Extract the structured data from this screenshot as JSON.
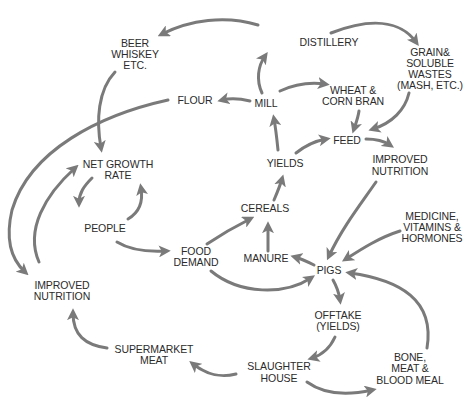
{
  "diagram": {
    "colors": {
      "arrow": "#7a7a7a",
      "text": "#2b2b2b",
      "background": "#ffffff"
    },
    "nodes": [
      {
        "id": "beer",
        "lines": [
          "BEER",
          "WHISKEY",
          "ETC."
        ],
        "x": 135,
        "y": [
          47,
          58,
          69
        ]
      },
      {
        "id": "distillery",
        "lines": [
          "DISTILLERY"
        ],
        "x": 329,
        "y": [
          46
        ]
      },
      {
        "id": "grain_wastes",
        "lines": [
          "GRAIN&",
          "SOLUBLE",
          "WASTES",
          "(MASH, ETC.)"
        ],
        "x": 430,
        "y": [
          56,
          67,
          78,
          89
        ]
      },
      {
        "id": "flour",
        "lines": [
          "FLOUR"
        ],
        "x": 195,
        "y": [
          104
        ]
      },
      {
        "id": "mill",
        "lines": [
          "MILL"
        ],
        "x": 266,
        "y": [
          107
        ]
      },
      {
        "id": "wheat_bran",
        "lines": [
          "WHEAT &",
          "CORN BRAN"
        ],
        "x": 353,
        "y": [
          94,
          105
        ]
      },
      {
        "id": "feed",
        "lines": [
          "FEED"
        ],
        "x": 347,
        "y": [
          144
        ]
      },
      {
        "id": "yields",
        "lines": [
          "YIELDS"
        ],
        "x": 285,
        "y": [
          167
        ]
      },
      {
        "id": "improved_nutrition_right",
        "lines": [
          "IMPROVED",
          "NUTRITION"
        ],
        "x": 400,
        "y": [
          163,
          175
        ]
      },
      {
        "id": "net_growth_rate",
        "lines": [
          "NET GROWTH",
          "RATE"
        ],
        "x": 118,
        "y": [
          168,
          179
        ]
      },
      {
        "id": "cereals",
        "lines": [
          "CEREALS"
        ],
        "x": 265,
        "y": [
          212
        ]
      },
      {
        "id": "people",
        "lines": [
          "PEOPLE"
        ],
        "x": 105,
        "y": [
          232
        ]
      },
      {
        "id": "food_demand",
        "lines": [
          "FOOD",
          "DEMAND"
        ],
        "x": 196,
        "y": [
          255,
          266
        ]
      },
      {
        "id": "manure",
        "lines": [
          "MANURE"
        ],
        "x": 266,
        "y": [
          262
        ]
      },
      {
        "id": "pigs",
        "lines": [
          "PIGS"
        ],
        "x": 329,
        "y": [
          274
        ]
      },
      {
        "id": "medicine",
        "lines": [
          "MEDICINE,",
          "VITAMINS &",
          "HORMONES"
        ],
        "x": 432,
        "y": [
          220,
          231,
          242
        ]
      },
      {
        "id": "improved_nutrition_left",
        "lines": [
          "IMPROVED",
          "NUTRITION"
        ],
        "x": 62,
        "y": [
          289,
          300
        ]
      },
      {
        "id": "offtake",
        "lines": [
          "OFFTAKE",
          "(YIELDS)"
        ],
        "x": 338,
        "y": [
          319,
          330
        ]
      },
      {
        "id": "supermarket_meat",
        "lines": [
          "SUPERMARKET",
          "MEAT"
        ],
        "x": 154,
        "y": [
          353,
          364
        ]
      },
      {
        "id": "slaughter_house",
        "lines": [
          "SLAUGHTER",
          "HOUSE"
        ],
        "x": 279,
        "y": [
          370,
          382
        ]
      },
      {
        "id": "bone_meal",
        "lines": [
          "BONE,",
          "MEAT &",
          "BLOOD MEAL"
        ],
        "x": 410,
        "y": [
          361,
          372,
          384
        ]
      }
    ],
    "edges": [
      {
        "from": "distillery",
        "to": "beer",
        "d": "M 258 25 C 225 15, 190 20, 162 34"
      },
      {
        "from": "distillery",
        "to": "grain_wastes",
        "d": "M 331 33 C 370 18, 400 20, 416 42"
      },
      {
        "from": "beer",
        "to": "net_growth_rate",
        "d": "M 115 72 C 98 90, 96 120, 101 148"
      },
      {
        "from": "mill",
        "to": "flour",
        "d": "M 250 101 C 238 98, 230 98, 222 100"
      },
      {
        "from": "mill",
        "to": "distillery",
        "d": "M 262 93 C 256 80, 258 66, 265 56"
      },
      {
        "from": "mill",
        "to": "wheat_bran",
        "d": "M 280 91 C 295 84, 310 82, 325 84"
      },
      {
        "from": "wheat_bran",
        "to": "feed",
        "d": "M 359 111 C 358 118, 356 123, 354 129"
      },
      {
        "from": "grain_wastes",
        "to": "feed",
        "d": "M 409 93 C 405 110, 392 123, 373 129"
      },
      {
        "from": "yields",
        "to": "mill",
        "d": "M 278 150 C 277 140, 276 130, 274 119"
      },
      {
        "from": "yields",
        "to": "feed",
        "d": "M 296 153 C 306 145, 315 141, 326 139"
      },
      {
        "from": "feed",
        "to": "improved_nutrition_right",
        "d": "M 366 139 C 376 139, 384 141, 390 145"
      },
      {
        "from": "improved_nutrition_right",
        "to": "pigs",
        "d": "M 376 182 C 360 205, 342 228, 329 256"
      },
      {
        "from": "cereals",
        "to": "yields",
        "d": "M 274 200 C 277 193, 280 186, 282 179"
      },
      {
        "from": "food_demand",
        "to": "cereals",
        "d": "M 207 244 C 222 234, 236 226, 250 219"
      },
      {
        "from": "manure",
        "to": "cereals",
        "d": "M 268 251 C 268 242, 268 234, 268 226"
      },
      {
        "from": "pigs",
        "to": "manure",
        "d": "M 314 265 C 308 262, 302 259, 295 257"
      },
      {
        "from": "food_demand",
        "to": "pigs",
        "d": "M 211 271 C 240 295, 285 295, 311 278"
      },
      {
        "from": "medicine",
        "to": "pigs",
        "d": "M 400 231 C 378 238, 360 250, 346 259"
      },
      {
        "from": "bone_meal",
        "to": "pigs",
        "d": "M 427 348 C 435 300, 400 280, 350 273"
      },
      {
        "from": "pigs",
        "to": "offtake",
        "d": "M 333 280 C 337 287, 339 293, 340 300"
      },
      {
        "from": "offtake",
        "to": "slaughter_house",
        "d": "M 335 337 C 330 348, 322 355, 312 358"
      },
      {
        "from": "slaughter_house",
        "to": "bone_meal",
        "d": "M 307 382 C 325 395, 350 395, 372 390"
      },
      {
        "from": "slaughter_house",
        "to": "supermarket_meat",
        "d": "M 236 374 C 220 378, 207 375, 193 364"
      },
      {
        "from": "supermarket_meat",
        "to": "improved_nutrition_left",
        "d": "M 107 348 C 85 345, 73 335, 73 313"
      },
      {
        "from": "improved_nutrition_left",
        "to": "net_growth_rate",
        "d": "M 39 262 C 25 230, 45 195, 75 168"
      },
      {
        "from": "flour",
        "to": "improved_nutrition_left",
        "d": "M 168 100 C 100 115, 30 150, 12 210 C 5 240, 12 260, 25 272"
      },
      {
        "from": "net_growth_rate",
        "to": "people",
        "d": "M 92 178 C 84 186, 79 193, 79 203"
      },
      {
        "from": "people",
        "to": "net_growth_rate",
        "d": "M 128 219 C 140 212, 143 200, 141 188"
      },
      {
        "from": "people",
        "to": "food_demand",
        "d": "M 117 242 C 130 250, 148 252, 166 251"
      }
    ]
  }
}
